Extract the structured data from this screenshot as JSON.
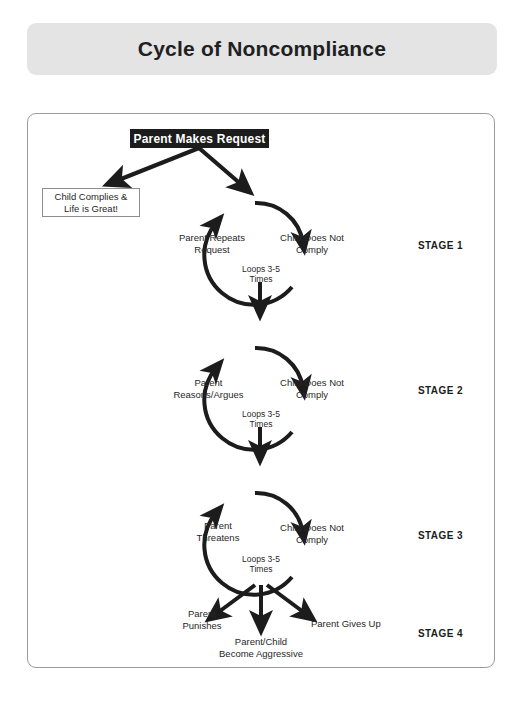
{
  "title": {
    "text": "Cycle of Noncompliance"
  },
  "colors": {
    "banner_bg": "#e4e4e4",
    "ink": "#1c1c1c",
    "card_border": "#9b9b9b",
    "box_fill": "#1c1c1c",
    "box_text": "#ffffff"
  },
  "diagram": {
    "start_node": {
      "label": "Parent Makes Request"
    },
    "exit_node": {
      "line1": "Child Complies &",
      "line2": "Life is Great!"
    },
    "loop_caption": {
      "line1": "Loops 3-5",
      "line2": "Times"
    },
    "stages": [
      {
        "stage_label": "STAGE 1",
        "left_node_line1": "Parent Repeats",
        "left_node_line2": "Request",
        "right_node_line1": "Child Does Not",
        "right_node_line2": "Comply",
        "loop_line1": "Loops 3-5",
        "loop_line2": "Times"
      },
      {
        "stage_label": "STAGE 2",
        "left_node_line1": "Parent",
        "left_node_line2": "Reasons/Argues",
        "right_node_line1": "Child Does Not",
        "right_node_line2": "Comply",
        "loop_line1": "Loops 3-5",
        "loop_line2": "Times"
      },
      {
        "stage_label": "STAGE 3",
        "left_node_line1": "Parent",
        "left_node_line2": "Threatens",
        "right_node_line1": "Child Does Not",
        "right_node_line2": "Comply",
        "loop_line1": "Loops 3-5",
        "loop_line2": "Times"
      }
    ],
    "stage4": {
      "stage_label": "STAGE 4",
      "outcome_left_line1": "Parent",
      "outcome_left_line2": "Punishes",
      "outcome_center_line1": "Parent/Child",
      "outcome_center_line2": "Become Aggressive",
      "outcome_right": "Parent Gives Up"
    }
  }
}
